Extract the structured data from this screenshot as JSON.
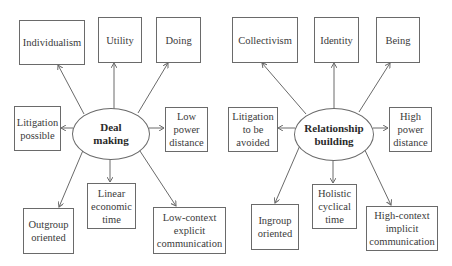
{
  "diagrams": [
    {
      "center": {
        "label": "Deal\nmaking"
      },
      "nodes": [
        {
          "id": "individualism",
          "label": "Individualism"
        },
        {
          "id": "utility",
          "label": "Utility"
        },
        {
          "id": "doing",
          "label": "Doing"
        },
        {
          "id": "litigation",
          "label": "Litigation\npossible"
        },
        {
          "id": "power",
          "label": "Low\npower\ndistance"
        },
        {
          "id": "outgroup",
          "label": "Outgroup\noriented"
        },
        {
          "id": "time",
          "label": "Linear\neconomic\ntime"
        },
        {
          "id": "context",
          "label": "Low-context\nexplicit\ncommunication"
        }
      ]
    },
    {
      "center": {
        "label": "Relationship\nbuilding"
      },
      "nodes": [
        {
          "id": "collectivism",
          "label": "Collectivism"
        },
        {
          "id": "identity",
          "label": "Identity"
        },
        {
          "id": "being",
          "label": "Being"
        },
        {
          "id": "litigation",
          "label": "Litigation\nto be\navoided"
        },
        {
          "id": "power",
          "label": "High\npower\ndistance"
        },
        {
          "id": "ingroup",
          "label": "Ingroup\noriented"
        },
        {
          "id": "time",
          "label": "Holistic\ncyclical\ntime"
        },
        {
          "id": "context",
          "label": "High-context\nimplicit\ncommunication"
        }
      ]
    }
  ],
  "colors": {
    "line": "#6a6a6a",
    "text": "#3a3a3a"
  }
}
